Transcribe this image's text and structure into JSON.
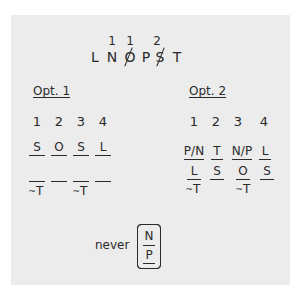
{
  "top_sequence": {
    "letters": [
      {
        "char": "L",
        "num": "",
        "struck": false
      },
      {
        "char": "N",
        "num": "1",
        "struck": false
      },
      {
        "char": "O",
        "num": "1",
        "struck": true
      },
      {
        "char": "P",
        "num": "",
        "struck": false
      },
      {
        "char": "S",
        "num": "2",
        "struck": true
      },
      {
        "char": "T",
        "num": "",
        "struck": false
      }
    ]
  },
  "opt1": {
    "heading": "Opt. 1",
    "positions": [
      "1",
      "2",
      "3",
      "4"
    ],
    "row1": [
      "S",
      "O",
      "S",
      "L"
    ],
    "row2": [
      {
        "text": "",
        "note": "~T"
      },
      {
        "text": "",
        "note": ""
      },
      {
        "text": "",
        "note": "~T"
      },
      {
        "text": "",
        "note": ""
      }
    ]
  },
  "opt2": {
    "heading": "Opt. 2",
    "positions": [
      "1",
      "2",
      "3",
      "4"
    ],
    "row1": [
      "P/N",
      "T",
      "N/P",
      "L"
    ],
    "row2": [
      {
        "text": "L",
        "note": "~T"
      },
      {
        "text": "S",
        "note": ""
      },
      {
        "text": "O",
        "note": "~T"
      },
      {
        "text": "S",
        "note": ""
      }
    ]
  },
  "never": {
    "label": "never",
    "top": "N",
    "bottom": "P"
  }
}
